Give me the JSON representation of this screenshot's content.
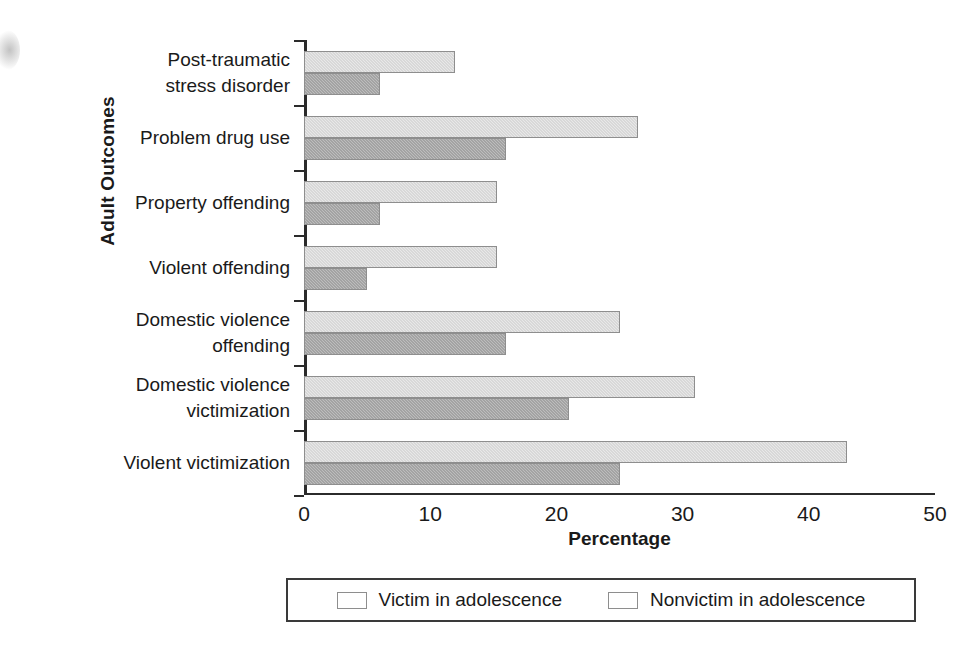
{
  "chart_data": {
    "type": "bar",
    "orientation": "horizontal",
    "title": "",
    "xlabel": "Percentage",
    "ylabel": "Adult Outcomes",
    "xlim": [
      0,
      50
    ],
    "xticks": [
      "0",
      "10",
      "20",
      "30",
      "40",
      "50"
    ],
    "grid": false,
    "legend_position": "bottom",
    "categories": [
      "Post-traumatic\nstress disorder",
      "Problem drug use",
      "Property offending",
      "Violent offending",
      "Domestic violence\noffending",
      "Domestic violence\nvictimization",
      "Violent victimization"
    ],
    "series": [
      {
        "name": "Victim in adolescence",
        "color": "#e8e8e8",
        "values": [
          12,
          26.5,
          15.3,
          15.3,
          25,
          31,
          43
        ]
      },
      {
        "name": "Nonvictim in adolescence",
        "color": "#bdbdbd",
        "values": [
          6,
          16,
          6,
          5,
          16,
          21,
          25
        ]
      }
    ]
  },
  "legend": {
    "items": [
      {
        "label": "Victim in adolescence",
        "swatch": "light"
      },
      {
        "label": "Nonvictim in adolescence",
        "swatch": "dark"
      }
    ]
  }
}
